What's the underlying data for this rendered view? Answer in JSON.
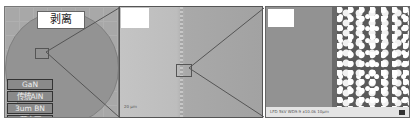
{
  "figure": {
    "panel1": {
      "title": "剥离",
      "layers": [
        "GaN",
        "传统AlN",
        "3um BN",
        "蓝宝石"
      ],
      "description": "wafer photo after peel-off with layer stack legend"
    },
    "panel2": {
      "description": "optical micrograph of peel edge",
      "scale_label": "20 μm"
    },
    "panel3": {
      "description": "SEM image of boundary between smooth and textured regions",
      "data_bar": "LFD   5kV  WD9.9  x10.0k  10μm"
    },
    "colors": {
      "background": "#ffffff",
      "wafer": "#939393",
      "layer_box": "#8a8a8a",
      "zoom_lines": "#555555"
    }
  }
}
